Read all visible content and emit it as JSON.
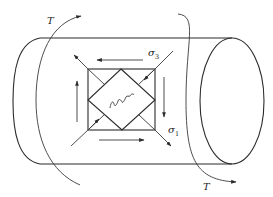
{
  "figure": {
    "labels": {
      "torque_top": "T",
      "torque_bottom": "T",
      "sigma3_symbol": "σ",
      "sigma3_sub": "3",
      "sigma1_symbol": "σ",
      "sigma1_sub": "1"
    },
    "colors": {
      "line": "#2b2b2b",
      "background": "#ffffff"
    }
  }
}
